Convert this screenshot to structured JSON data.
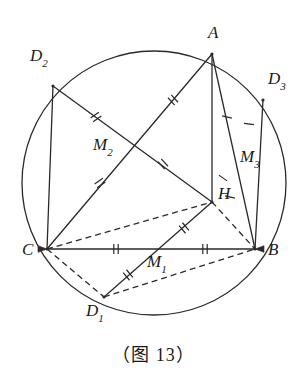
{
  "figure": {
    "caption": "（图 13）",
    "stroke_color": "#2a2a2a",
    "background_color": "#ffffff",
    "circle": {
      "cx": 154,
      "cy": 183,
      "r": 132
    },
    "points": {
      "A": {
        "x": 212,
        "y": 54,
        "label": "A",
        "sub": "",
        "lx": 208,
        "ly": 24
      },
      "B": {
        "x": 255,
        "y": 249,
        "label": "B",
        "sub": "",
        "lx": 268,
        "ly": 241
      },
      "C": {
        "x": 47,
        "y": 249,
        "label": "C",
        "sub": "",
        "lx": 22,
        "ly": 241
      },
      "H": {
        "x": 212,
        "y": 202,
        "label": "H",
        "sub": "",
        "lx": 218,
        "ly": 185
      },
      "M1": {
        "x": 151,
        "y": 249,
        "label": "M",
        "sub": "1",
        "lx": 147,
        "ly": 253
      },
      "M2": {
        "x": 134,
        "y": 146,
        "label": "M",
        "sub": "2",
        "lx": 93,
        "ly": 136
      },
      "M3": {
        "x": 235,
        "y": 155,
        "label": "M",
        "sub": "3",
        "lx": 240,
        "ly": 148
      },
      "D1": {
        "x": 104,
        "y": 297,
        "label": "D",
        "sub": "1",
        "lx": 86,
        "ly": 302
      },
      "D2": {
        "x": 53,
        "y": 86,
        "label": "D",
        "sub": "2",
        "lx": 30,
        "ly": 47
      },
      "D3": {
        "x": 263,
        "y": 100,
        "label": "D",
        "sub": "3",
        "lx": 268,
        "ly": 70
      }
    },
    "solid_segments": [
      {
        "name": "segment-C-B",
        "from": "C",
        "to": "B"
      },
      {
        "name": "segment-A-C",
        "from": "A",
        "to": "C"
      },
      {
        "name": "segment-A-B",
        "from": "A",
        "to": "B"
      },
      {
        "name": "segment-D2-C",
        "from": "D2",
        "to": "C"
      },
      {
        "name": "segment-D1-H",
        "from": "D1",
        "to": "H"
      },
      {
        "name": "segment-D3-B",
        "from": "D3",
        "to": "B"
      },
      {
        "name": "segment-A-H",
        "from": "A",
        "to": "H"
      },
      {
        "name": "segment-D2-M2-extend",
        "from": "D2",
        "to": "H"
      }
    ],
    "dashed_segments": [
      {
        "name": "dashed-C-H",
        "from": "C",
        "to": "H"
      },
      {
        "name": "dashed-C-D1",
        "from": "C",
        "to": "D1"
      },
      {
        "name": "dashed-D1-B",
        "from": "D1",
        "to": "B"
      },
      {
        "name": "dashed-H-B",
        "from": "H",
        "to": "B"
      }
    ],
    "tick_marks": [
      {
        "name": "tick-CB-left",
        "x": 116,
        "y": 249,
        "angle": 0,
        "count": 2
      },
      {
        "name": "tick-CB-right",
        "x": 205,
        "y": 249,
        "angle": 0,
        "count": 2
      },
      {
        "name": "tick-D2C-upper",
        "x": 96,
        "y": 117,
        "angle": 55,
        "count": 2
      },
      {
        "name": "tick-D2C-lower",
        "x": 100,
        "y": 183,
        "angle": 55,
        "count": 2
      },
      {
        "name": "tick-AC-upper",
        "x": 173,
        "y": 100,
        "angle": -42,
        "count": 2
      },
      {
        "name": "tick-AC-lower",
        "x": 163,
        "y": 164,
        "angle": -42,
        "count": 2
      },
      {
        "name": "tick-D1H-upper",
        "x": 184,
        "y": 228,
        "angle": -40,
        "count": 2
      },
      {
        "name": "tick-D1H-lower",
        "x": 128,
        "y": 275,
        "angle": -40,
        "count": 2
      },
      {
        "name": "tick-AB-upper",
        "x": 227,
        "y": 117,
        "angle": -78,
        "count": 1
      },
      {
        "name": "tick-AB-lower",
        "x": 230,
        "y": 197,
        "angle": -78,
        "count": 1
      },
      {
        "name": "tick-D3B-upper",
        "x": 249,
        "y": 124,
        "angle": -83,
        "count": 1
      },
      {
        "name": "tick-D3B-lower",
        "x": 223,
        "y": 178,
        "angle": -55,
        "count": 1
      }
    ],
    "arrowheads": [
      {
        "name": "arrowhead-at-C",
        "x": 47,
        "y": 249,
        "angle": 180
      },
      {
        "name": "arrowhead-at-B",
        "x": 255,
        "y": 249,
        "angle": 0
      }
    ]
  }
}
